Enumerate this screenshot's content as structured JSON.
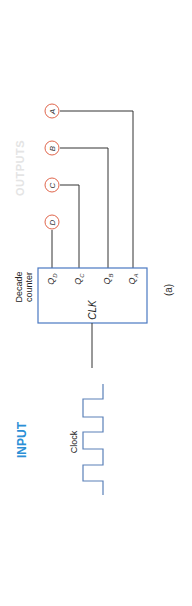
{
  "labels": {
    "outputs": "OUTPUTS",
    "input": "INPUT",
    "clock": "Clock",
    "counter_line1": "Decade",
    "counter_line2": "counter",
    "clk_pin": "CLK",
    "caption": "(a)"
  },
  "outputs": [
    {
      "name": "A",
      "pin": "Q",
      "sub": "A"
    },
    {
      "name": "B",
      "pin": "Q",
      "sub": "B"
    },
    {
      "name": "C",
      "pin": "Q",
      "sub": "C"
    },
    {
      "name": "D",
      "pin": "Q",
      "sub": "D"
    }
  ],
  "colors": {
    "input_label": "#2b8fd6",
    "output_circle": "#e0664c",
    "box_border": "#4a78c2",
    "clock_wave": "#5a80b8",
    "wire": "#333333"
  }
}
